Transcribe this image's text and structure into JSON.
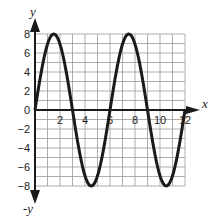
{
  "chart_data": {
    "type": "line",
    "title": "",
    "xlabel": "x",
    "ylabel": "y",
    "ylabel_negative": "-y",
    "xlim": [
      0,
      12
    ],
    "ylim": [
      -8,
      8
    ],
    "grid": true,
    "grid_step_x": 1,
    "grid_step_y": 1,
    "x_ticks": [
      2,
      4,
      6,
      8,
      10,
      12
    ],
    "x_tick_labels": [
      "2",
      "4",
      "6",
      "8",
      "10",
      "12"
    ],
    "y_ticks": [
      8,
      6,
      4,
      2,
      0,
      -2,
      -4,
      -6,
      -8
    ],
    "y_tick_labels": [
      "8",
      "6",
      "4",
      "2",
      "0",
      "−2",
      "−4",
      "−6",
      "−8"
    ],
    "series": [
      {
        "name": "y = 8 sin(πx/3)",
        "amplitude": 8,
        "period": 6,
        "x": [
          0,
          1.5,
          3,
          4.5,
          6,
          7.5,
          9,
          10.5,
          12
        ],
        "values": [
          0,
          8,
          0,
          -8,
          0,
          8,
          0,
          -8,
          0
        ]
      }
    ],
    "colors": {
      "curve": "#1a1a1a",
      "grid": "#9a9a9a",
      "axis": "#1a1a1a"
    }
  }
}
